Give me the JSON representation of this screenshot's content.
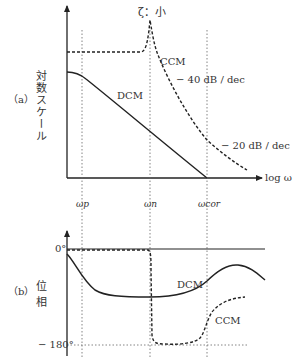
{
  "figure": {
    "panel_a": {
      "label": "（a）",
      "y_axis_label": "対数スケール",
      "x_axis_label": "log ω",
      "annotation_peak": "ζ：小",
      "curves": {
        "ccm_label": "CCM",
        "dcm_label": "DCM"
      },
      "slopes": {
        "ccm_slope": "− 40 dB / dec",
        "dcm_slope": "− 20 dB / dec"
      }
    },
    "frequencies": {
      "omega_p": "ωp",
      "omega_n": "ωn",
      "omega_cor": "ωcor"
    },
    "panel_b": {
      "label": "（b）",
      "y_axis_label": "位  相",
      "tick_top": "0°",
      "tick_bottom": "− 180°",
      "curves": {
        "dcm_label": "DCM",
        "ccm_label": "CCM"
      }
    },
    "colors": {
      "line": "#222222",
      "guide": "#555555",
      "background": "#ffffff"
    }
  }
}
